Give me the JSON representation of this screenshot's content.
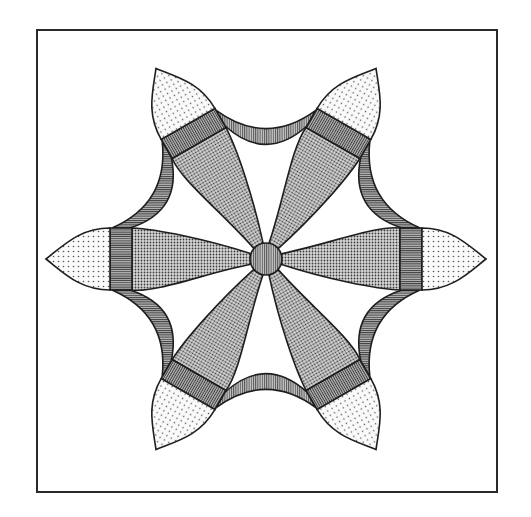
{
  "figure": {
    "frame": {
      "x": 37,
      "y": 30,
      "width": 460,
      "height": 462,
      "stroke": "#2a2a2a"
    },
    "center": {
      "x": 266,
      "y": 259,
      "radius": 16,
      "fill": "#8c8c8c"
    },
    "petal_angles_deg": [
      0,
      60,
      120,
      180,
      240,
      300
    ],
    "petal": {
      "length": 220,
      "band_start": 134,
      "band_end": 156,
      "half_width": 31
    },
    "colors": {
      "outline": "#1e1e1e",
      "body_fill": "#9a9a9a",
      "band_fill": "#7a7a7a",
      "tip_fill": "#ececec",
      "arc_fill": "#b2b2b2",
      "background": "#ffffff"
    },
    "pieces": [
      {
        "name": "center-circle",
        "pattern": "vertical-stripes"
      },
      {
        "name": "petal-body",
        "pattern": "fine-dots",
        "count": 6
      },
      {
        "name": "petal-band",
        "pattern": "horizontal-stripes",
        "count": 6
      },
      {
        "name": "petal-tip",
        "pattern": "sparse-dots",
        "count": 6
      },
      {
        "name": "connector-arc",
        "pattern": "stripes",
        "count": 6
      }
    ]
  }
}
